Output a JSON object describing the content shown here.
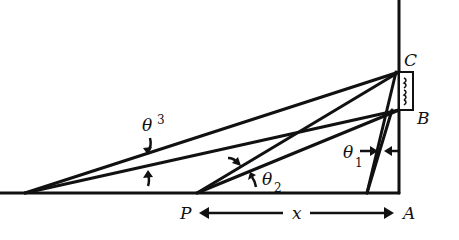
{
  "diagram": {
    "type": "geometry-figure",
    "points": {
      "C": {
        "label": "C",
        "x": 399,
        "y": 72
      },
      "B": {
        "label": "B",
        "x": 399,
        "y": 110
      },
      "A": {
        "label": "A",
        "x": 399,
        "y": 193
      },
      "P": {
        "label": "P",
        "x": 197,
        "y": 193
      }
    },
    "angles": [
      {
        "label": "θ",
        "subscript": "1"
      },
      {
        "label": "θ",
        "subscript": "2"
      },
      {
        "label": "θ",
        "subscript": "3"
      }
    ],
    "distance": {
      "label": "x",
      "from": "P",
      "to": "A"
    },
    "colors": {
      "ink": "#111111",
      "background": "#ffffff"
    }
  }
}
